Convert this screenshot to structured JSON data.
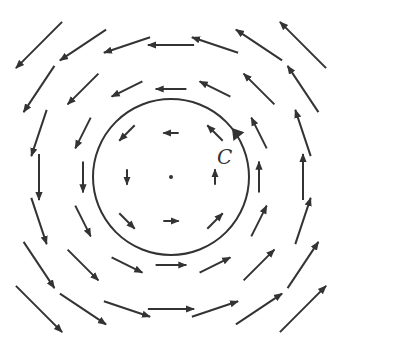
{
  "diagram": {
    "type": "vector-field",
    "curve": {
      "label": "C",
      "shape": "circle",
      "center": [
        171,
        177
      ],
      "radius": 78,
      "orientation": "counterclockwise",
      "arrowhead_at": [
        232,
        128
      ]
    },
    "grid": {
      "columns": 7,
      "rows": 7,
      "origin": [
        171,
        177
      ],
      "spacing": 44,
      "scale": 0.35
    },
    "center_point": {
      "x": 171,
      "y": 177,
      "label": ""
    },
    "colors": {
      "stroke": "#333333",
      "background": "#ffffff"
    }
  }
}
